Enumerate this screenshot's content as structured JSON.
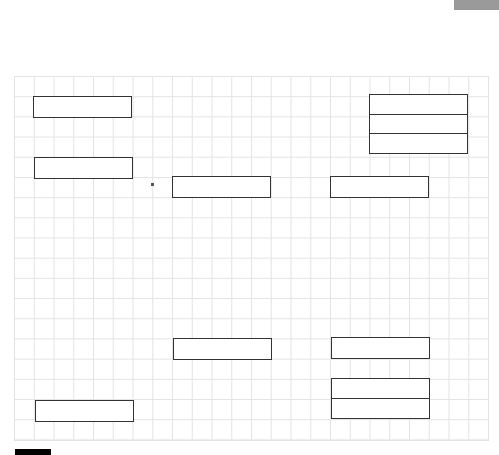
{
  "canvas": {
    "background": "#ffffff",
    "grid_color": "#e3e3e3",
    "box_border": "#333333"
  },
  "boxes": [
    {
      "id": "box-a",
      "x": 33,
      "y": 96,
      "w": 99,
      "h": 22
    },
    {
      "id": "box-b",
      "x": 34,
      "y": 157,
      "w": 99,
      "h": 22
    },
    {
      "id": "box-c",
      "x": 172,
      "y": 176,
      "w": 99,
      "h": 22
    },
    {
      "id": "box-d",
      "x": 330,
      "y": 176,
      "w": 99,
      "h": 22
    },
    {
      "id": "box-e",
      "x": 173,
      "y": 338,
      "w": 99,
      "h": 22
    },
    {
      "id": "box-f",
      "x": 331,
      "y": 337,
      "w": 99,
      "h": 22
    },
    {
      "id": "box-g",
      "x": 35,
      "y": 400,
      "w": 99,
      "h": 22
    }
  ],
  "stacks": [
    {
      "id": "stack-top-right",
      "x": 369,
      "y": 94,
      "w": 99,
      "cells": 3
    },
    {
      "id": "stack-bottom-right",
      "x": 331,
      "y": 378,
      "w": 99,
      "cells": 2
    }
  ]
}
